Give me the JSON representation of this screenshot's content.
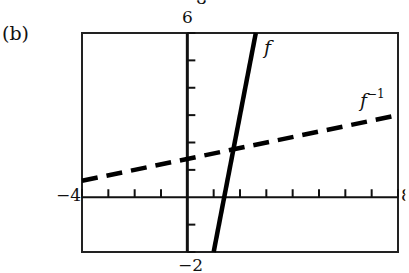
{
  "figure": {
    "part_label": "(b)",
    "y_max_label": "6",
    "y_min_label": "−2",
    "x_min_label": "−4",
    "x_max_label": "8",
    "top_cut_label": "8"
  },
  "chart_data": {
    "type": "line",
    "title": "",
    "xlabel": "",
    "ylabel": "",
    "xlim": [
      -4,
      8
    ],
    "ylim": [
      -2,
      6
    ],
    "x_tick_step": 1,
    "y_tick_step": 1,
    "grid": false,
    "series": [
      {
        "name": "f",
        "style": "solid",
        "equation": "y = 5x - 7",
        "points": [
          [
            1,
            -2
          ],
          [
            2.6,
            6
          ]
        ]
      },
      {
        "name": "f^-1",
        "style": "dashed",
        "equation": "y = (x + 7) / 5",
        "points": [
          [
            -4,
            0.6
          ],
          [
            8,
            3
          ]
        ]
      }
    ],
    "annotations": [
      {
        "text": "f",
        "near": [
          2.9,
          5.5
        ]
      },
      {
        "text": "f^-1",
        "near": [
          6.6,
          3.5
        ]
      }
    ]
  },
  "labels": {
    "f": "f",
    "finv_base": "f",
    "finv_sup": "−1"
  }
}
